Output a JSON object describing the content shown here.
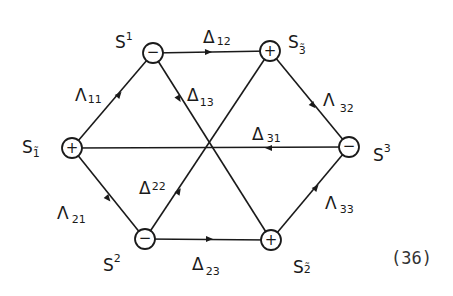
{
  "diagram": {
    "equation_number": "(36)",
    "nodes": [
      {
        "id": "S1",
        "label": "S",
        "sup": "1",
        "sub": "",
        "sign": "−",
        "x": 153,
        "y": 53
      },
      {
        "id": "S3t",
        "label": "S",
        "sup": "",
        "sub": "3̃",
        "sign": "+",
        "x": 270,
        "y": 51
      },
      {
        "id": "S1t",
        "label": "S",
        "sup": "",
        "sub": "1̃",
        "sign": "+",
        "x": 72,
        "y": 148
      },
      {
        "id": "S3",
        "label": "S",
        "sup": "3",
        "sub": "",
        "sign": "−",
        "x": 349,
        "y": 147
      },
      {
        "id": "S2",
        "label": "S",
        "sup": "2",
        "sub": "",
        "sign": "−",
        "x": 145,
        "y": 239
      },
      {
        "id": "S2t",
        "label": "S",
        "sup": "",
        "sub": "2̃",
        "sign": "+",
        "x": 271,
        "y": 240
      }
    ],
    "edges": [
      {
        "id": "L11",
        "symbol": "Λ",
        "index": "11",
        "from": "S1t",
        "to": "S1"
      },
      {
        "id": "D12",
        "symbol": "Δ",
        "index": "12",
        "from": "S1",
        "to": "S3t"
      },
      {
        "id": "D13",
        "symbol": "Δ",
        "index": "13",
        "from": "S1",
        "to": "S2t"
      },
      {
        "id": "L32",
        "symbol": "Λ",
        "index": "32",
        "from": "S3t",
        "to": "S3"
      },
      {
        "id": "D31",
        "symbol": "Δ",
        "index": "31",
        "from": "S3",
        "to": "S1t"
      },
      {
        "id": "L21",
        "symbol": "Λ",
        "index": "21",
        "from": "S1t",
        "to": "S2"
      },
      {
        "id": "D22",
        "symbol": "Δ",
        "index": "22",
        "from": "S2",
        "to": "S3t"
      },
      {
        "id": "D23",
        "symbol": "Δ",
        "index": "23",
        "from": "S2",
        "to": "S2t"
      },
      {
        "id": "L33",
        "symbol": "Λ",
        "index": "33",
        "from": "S2t",
        "to": "S3"
      }
    ],
    "labels": {
      "S1": {
        "main": "S",
        "sup": "1"
      },
      "S3t": {
        "main": "S",
        "sub": "3̃"
      },
      "S1t": {
        "main": "S",
        "sub": "1̃"
      },
      "S3": {
        "main": "S",
        "sup": "3"
      },
      "S2": {
        "main": "S",
        "sup": "2"
      },
      "S2t": {
        "main": "S",
        "sub": "2̃"
      },
      "L11": {
        "main": "Λ",
        "sub": "11"
      },
      "D12": {
        "main": "Δ",
        "sub": "12"
      },
      "D13": {
        "main": "Δ",
        "sub": "13"
      },
      "L32": {
        "main": "Λ",
        "sub": "32"
      },
      "D31": {
        "main": "Δ",
        "sub": "31"
      },
      "L21": {
        "main": "Λ",
        "sub": "21"
      },
      "D22": {
        "main": "Δ",
        "sub": "22"
      },
      "D23": {
        "main": "Δ",
        "sub": "23"
      },
      "L33": {
        "main": "Λ",
        "sub": "33"
      }
    },
    "signs": {
      "plus": "+",
      "minus": "−"
    }
  }
}
